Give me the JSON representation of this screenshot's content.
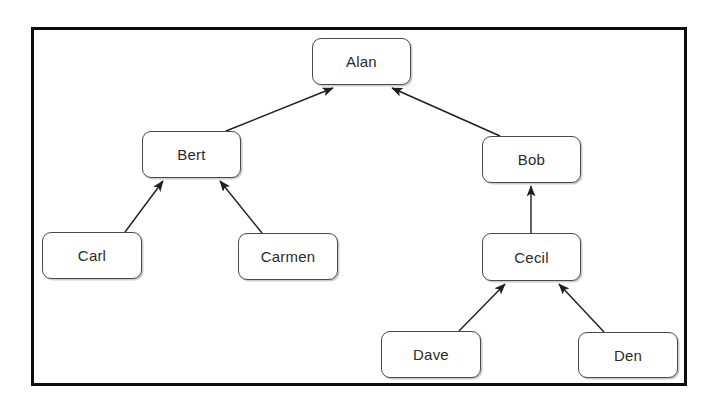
{
  "diagram": {
    "type": "tree",
    "background_color": "#ffffff",
    "frame": {
      "border_color": "#0d0d0d",
      "x": 31,
      "y": 27,
      "width": 656,
      "height": 359
    },
    "node_style": {
      "fill": "#ffffff",
      "stroke": "#4a4a4a",
      "text_color": "#2b2b2b",
      "corner_radius": 9
    },
    "edge_style": {
      "stroke": "#1f1f1f",
      "arrowhead": "filled-triangle",
      "direction": "child-to-parent"
    },
    "nodes": [
      {
        "id": "alan",
        "label": "Alan",
        "x": 312,
        "y": 38,
        "width": 99,
        "height": 47,
        "level": 0
      },
      {
        "id": "bert",
        "label": "Bert",
        "x": 142,
        "y": 131,
        "width": 99,
        "height": 47,
        "level": 1
      },
      {
        "id": "bob",
        "label": "Bob",
        "x": 482,
        "y": 136,
        "width": 99,
        "height": 47,
        "level": 1
      },
      {
        "id": "carl",
        "label": "Carl",
        "x": 42,
        "y": 232,
        "width": 100,
        "height": 47,
        "level": 2
      },
      {
        "id": "carmen",
        "label": "Carmen",
        "x": 238,
        "y": 233,
        "width": 100,
        "height": 47,
        "level": 2
      },
      {
        "id": "cecil",
        "label": "Cecil",
        "x": 482,
        "y": 233,
        "width": 99,
        "height": 48,
        "level": 2
      },
      {
        "id": "dave",
        "label": "Dave",
        "x": 381,
        "y": 331,
        "width": 100,
        "height": 47,
        "level": 3
      },
      {
        "id": "den",
        "label": "Den",
        "x": 578,
        "y": 332,
        "width": 100,
        "height": 46,
        "level": 3
      }
    ],
    "edges": [
      {
        "id": "bert-alan",
        "from": "bert",
        "to": "alan",
        "from_point": [
          226,
          131
        ],
        "to_point": [
          333,
          88
        ]
      },
      {
        "id": "bob-alan",
        "from": "bob",
        "to": "alan",
        "from_point": [
          500,
          136
        ],
        "to_point": [
          392,
          88
        ]
      },
      {
        "id": "carl-bert",
        "from": "carl",
        "to": "bert",
        "from_point": [
          125,
          232
        ],
        "to_point": [
          163,
          181
        ]
      },
      {
        "id": "carmen-bert",
        "from": "carmen",
        "to": "bert",
        "from_point": [
          262,
          233
        ],
        "to_point": [
          220,
          181
        ]
      },
      {
        "id": "cecil-bob",
        "from": "cecil",
        "to": "bob",
        "from_point": [
          531,
          233
        ],
        "to_point": [
          531,
          186
        ]
      },
      {
        "id": "dave-cecil",
        "from": "dave",
        "to": "cecil",
        "from_point": [
          459,
          331
        ],
        "to_point": [
          505,
          284
        ]
      },
      {
        "id": "den-cecil",
        "from": "den",
        "to": "cecil",
        "from_point": [
          604,
          332
        ],
        "to_point": [
          559,
          284
        ]
      }
    ]
  }
}
